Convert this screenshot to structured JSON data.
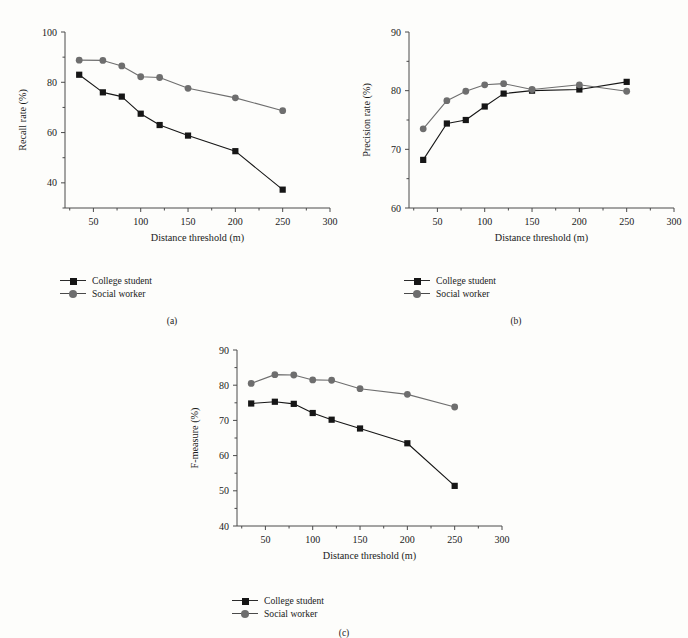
{
  "figure": {
    "background": "#fdfdfb",
    "series_colors": {
      "college_student": "#161616",
      "social_worker": "#6e6e6e"
    }
  },
  "legend": {
    "items": [
      {
        "label": "College student",
        "marker": "square-marker",
        "color": "#161616"
      },
      {
        "label": "Social worker",
        "marker": "circle-marker",
        "color": "#6e6e6e"
      }
    ]
  },
  "panels": [
    {
      "id": "a",
      "caption": "(a)"
    },
    {
      "id": "b",
      "caption": "(b)"
    },
    {
      "id": "c",
      "caption": "(c)"
    }
  ],
  "chart_data": [
    {
      "type": "line",
      "panel": "a",
      "title": "",
      "xlabel": "Distance threshold (m)",
      "ylabel": "Recall rate (%)",
      "x": [
        35,
        60,
        80,
        100,
        120,
        150,
        200,
        250
      ],
      "xlim": [
        20,
        300
      ],
      "ylim": [
        30,
        100
      ],
      "xticks": [
        50,
        100,
        150,
        200,
        250,
        300
      ],
      "yticks": [
        40,
        60,
        80,
        100
      ],
      "yminor": [
        30,
        50,
        70,
        90
      ],
      "grid": false,
      "legend_position": "below-left",
      "series": [
        {
          "name": "College student",
          "marker": "square",
          "color": "#161616",
          "values": [
            83.0,
            76.0,
            74.3,
            67.5,
            63.0,
            58.8,
            52.6,
            37.3
          ]
        },
        {
          "name": "Social worker",
          "marker": "circle",
          "color": "#6e6e6e",
          "values": [
            88.8,
            88.7,
            86.5,
            82.2,
            81.9,
            77.6,
            73.8,
            68.7
          ]
        }
      ]
    },
    {
      "type": "line",
      "panel": "b",
      "title": "",
      "xlabel": "Distance threshold (m)",
      "ylabel": "Precision rate (%)",
      "x": [
        35,
        60,
        80,
        100,
        120,
        150,
        200,
        250
      ],
      "xlim": [
        20,
        300
      ],
      "ylim": [
        60,
        90
      ],
      "xticks": [
        50,
        100,
        150,
        200,
        250,
        300
      ],
      "yticks": [
        60,
        70,
        80,
        90
      ],
      "yminor": [
        65,
        75,
        85
      ],
      "grid": false,
      "legend_position": "below-left",
      "series": [
        {
          "name": "College student",
          "marker": "square",
          "color": "#161616",
          "values": [
            68.2,
            74.4,
            75.0,
            77.3,
            79.5,
            80.0,
            80.2,
            81.5
          ]
        },
        {
          "name": "Social worker",
          "marker": "circle",
          "color": "#6e6e6e",
          "values": [
            73.5,
            78.3,
            79.9,
            81.0,
            81.2,
            80.2,
            81.0,
            79.9
          ]
        }
      ]
    },
    {
      "type": "line",
      "panel": "c",
      "title": "",
      "xlabel": "Distance threshold (m)",
      "ylabel": "F-measure (%)",
      "x": [
        35,
        60,
        80,
        100,
        120,
        150,
        200,
        250
      ],
      "xlim": [
        20,
        300
      ],
      "ylim": [
        40,
        90
      ],
      "xticks": [
        50,
        100,
        150,
        200,
        250,
        300
      ],
      "yticks": [
        40,
        50,
        60,
        70,
        80,
        90
      ],
      "yminor": [
        45,
        55,
        65,
        75,
        85
      ],
      "grid": false,
      "legend_position": "below-left",
      "series": [
        {
          "name": "College student",
          "marker": "square",
          "color": "#161616",
          "values": [
            74.8,
            75.3,
            74.7,
            72.1,
            70.2,
            67.7,
            63.5,
            51.4
          ]
        },
        {
          "name": "Social worker",
          "marker": "circle",
          "color": "#6e6e6e",
          "values": [
            80.5,
            83.0,
            82.9,
            81.5,
            81.4,
            79.0,
            77.4,
            73.8
          ]
        }
      ]
    }
  ]
}
